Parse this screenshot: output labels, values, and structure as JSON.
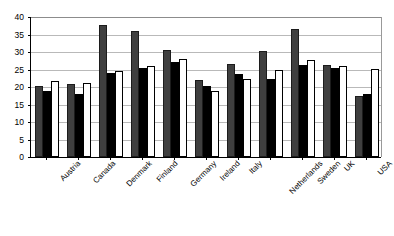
{
  "chart_data": {
    "type": "bar",
    "title": "",
    "subtitle": "",
    "xlabel": "",
    "ylabel": "",
    "ylim": [
      0,
      40
    ],
    "yticks": [
      0,
      5,
      10,
      15,
      20,
      25,
      30,
      35,
      40
    ],
    "grid": true,
    "legend_position": "none",
    "categories": [
      "Austria",
      "Canada",
      "Denmark",
      "Finland",
      "Germany",
      "Ireland",
      "Italy",
      "Netherlands",
      "Sweden",
      "UK",
      "USA"
    ],
    "series": [
      {
        "name": "series-1",
        "color": "#3f3f3f",
        "values": [
          20.4,
          21.0,
          37.7,
          36.0,
          30.6,
          22.0,
          26.7,
          30.4,
          36.6,
          26.3,
          17.5
        ]
      },
      {
        "name": "series-2",
        "color": "#000000",
        "values": [
          19.0,
          18.0,
          24.1,
          25.5,
          27.2,
          20.3,
          23.6,
          22.3,
          26.4,
          25.4,
          18.1
        ]
      },
      {
        "name": "series-3",
        "color": "#ffffff",
        "values": [
          21.6,
          21.2,
          24.6,
          26.0,
          27.9,
          19.0,
          22.2,
          24.9,
          27.8,
          25.9,
          25.2
        ]
      }
    ]
  }
}
